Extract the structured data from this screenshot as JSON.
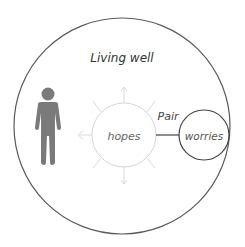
{
  "diagram": {
    "title": "Living well",
    "nodes": [
      {
        "id": "person",
        "type": "icon",
        "icon": "person-icon"
      },
      {
        "id": "hopes",
        "label": "hopes",
        "style": "light-circle-with-rays"
      },
      {
        "id": "worries",
        "label": "worries",
        "style": "dark-circle"
      }
    ],
    "edges": [
      {
        "from": "hopes",
        "to": "worries",
        "label": "Pair"
      },
      {
        "from": "hopes",
        "to": "person",
        "style": "light-arrow"
      }
    ],
    "colors": {
      "outer_circle": "#555555",
      "person": "#777777",
      "hopes_circle": "#d8d8d8",
      "worries_circle": "#444444",
      "connector": "#444444"
    }
  }
}
